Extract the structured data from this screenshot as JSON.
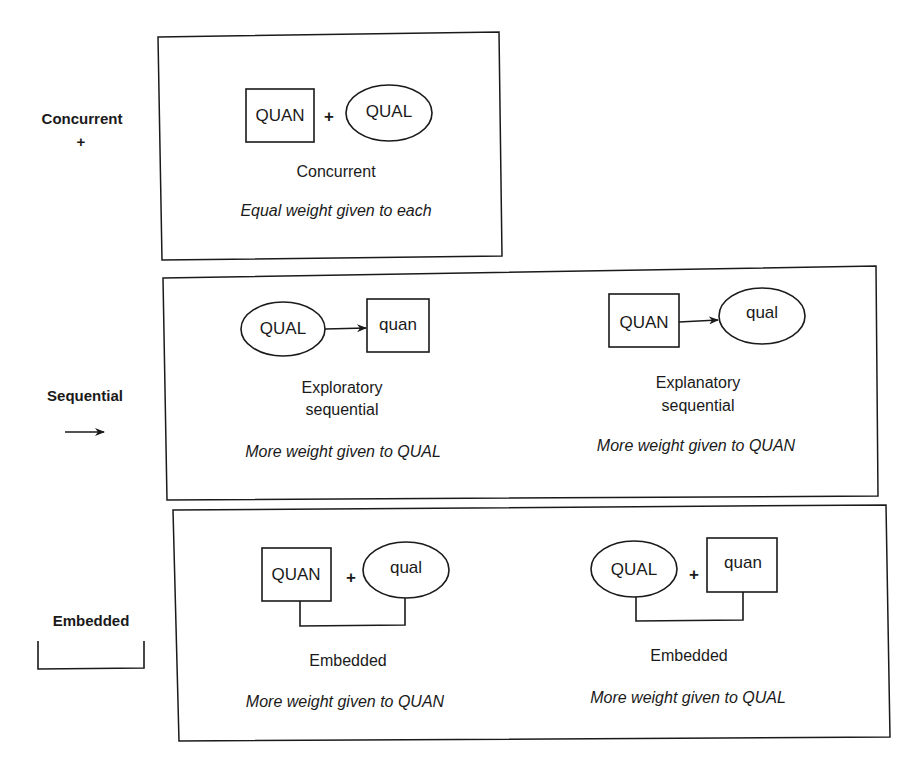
{
  "rows": [
    {
      "id": "concurrent",
      "label": "Concurrent",
      "symbol": "+",
      "designs": [
        {
          "first": {
            "label": "QUAN",
            "shape": "square"
          },
          "connector": "+",
          "second": {
            "label": "QUAL",
            "shape": "ellipse"
          },
          "name": "Concurrent",
          "weight": "Equal weight given to each"
        }
      ]
    },
    {
      "id": "sequential",
      "label": "Sequential",
      "symbol": "arrow-right-icon",
      "designs": [
        {
          "first": {
            "label": "QUAL",
            "shape": "ellipse"
          },
          "connector": "arrow",
          "second": {
            "label": "quan",
            "shape": "square"
          },
          "name_line1": "Exploratory",
          "name_line2": "sequential",
          "weight": "More weight given to QUAL"
        },
        {
          "first": {
            "label": "QUAN",
            "shape": "square"
          },
          "connector": "arrow",
          "second": {
            "label": "qual",
            "shape": "ellipse"
          },
          "name_line1": "Explanatory",
          "name_line2": "sequential",
          "weight": "More weight given to QUAN"
        }
      ]
    },
    {
      "id": "embedded",
      "label": "Embedded",
      "symbol": "bracket-icon",
      "designs": [
        {
          "first": {
            "label": "QUAN",
            "shape": "square"
          },
          "connector": "+",
          "second": {
            "label": "qual",
            "shape": "ellipse"
          },
          "name": "Embedded",
          "weight": "More weight given to QUAN"
        },
        {
          "first": {
            "label": "QUAL",
            "shape": "ellipse"
          },
          "connector": "+",
          "second": {
            "label": "quan",
            "shape": "square"
          },
          "name": "Embedded",
          "weight": "More weight given to QUAL"
        }
      ]
    }
  ],
  "colors": {
    "stroke": "#1a1a1a",
    "background": "#ffffff"
  }
}
